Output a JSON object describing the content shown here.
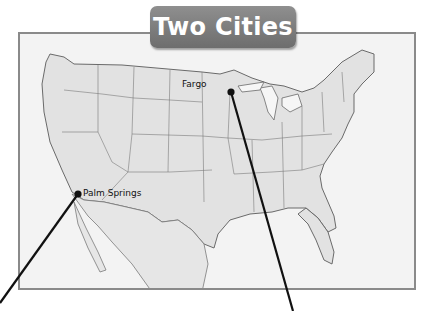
{
  "title": "Two Cities",
  "map": {
    "region": "United States",
    "colors": {
      "land": "#e2e2e2",
      "water": "#f4f4f4",
      "border": "#8a8a8a",
      "badge": "#7d7d7d",
      "pointer": "#111111"
    }
  },
  "cities": [
    {
      "name": "Fargo",
      "dot": [
        231,
        92
      ],
      "label_pos": [
        182,
        79
      ],
      "pointer_end": [
        293,
        311
      ]
    },
    {
      "name": "Palm Springs",
      "dot": [
        78,
        194
      ],
      "label_pos": [
        82,
        188
      ],
      "pointer_end": [
        0,
        303
      ]
    }
  ]
}
